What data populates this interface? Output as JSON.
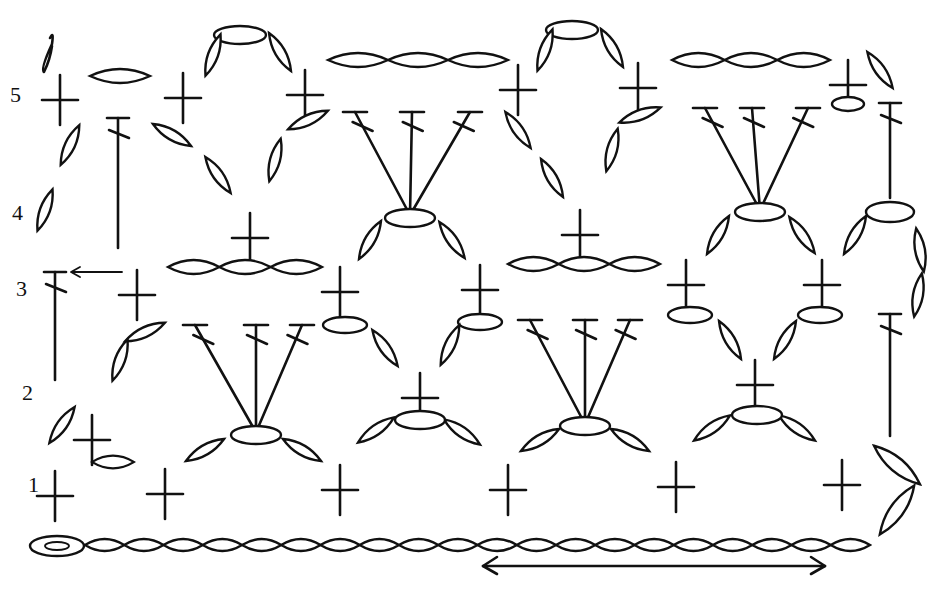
{
  "diagram": {
    "type": "crochet-stitch-chart",
    "ink_color": "#111111",
    "background_color": "#ffffff",
    "start_mark": "δ",
    "row_labels": [
      {
        "label": "1",
        "x": 28,
        "y": 492
      },
      {
        "label": "2",
        "x": 22,
        "y": 400
      },
      {
        "label": "3",
        "x": 16,
        "y": 296
      },
      {
        "label": "4",
        "x": 12,
        "y": 220
      },
      {
        "label": "5",
        "x": 10,
        "y": 102
      }
    ],
    "repeat_arrow": {
      "x1": 483,
      "x2": 825,
      "y": 566,
      "direction": "both"
    },
    "row3_turn_arrow": {
      "x1": 122,
      "x2": 70,
      "y": 272
    },
    "foundation_chain": {
      "start_x": 30,
      "end_x": 880,
      "y": 545,
      "count": 21,
      "first_is_slip_ring": true
    },
    "stitches": {
      "single_crochet": [
        [
          55,
          496
        ],
        [
          165,
          494
        ],
        [
          340,
          490
        ],
        [
          508,
          490
        ],
        [
          676,
          487
        ],
        [
          842,
          485
        ],
        [
          92,
          440
        ],
        [
          420,
          398
        ],
        [
          755,
          385
        ],
        [
          137,
          295
        ],
        [
          340,
          292
        ],
        [
          480,
          290
        ],
        [
          686,
          285
        ],
        [
          822,
          285
        ],
        [
          250,
          238
        ],
        [
          580,
          235
        ],
        [
          60,
          100
        ],
        [
          183,
          98
        ],
        [
          305,
          95
        ],
        [
          518,
          90
        ],
        [
          638,
          88
        ],
        [
          848,
          85
        ]
      ],
      "double_crochet_fans": [
        {
          "base": [
            256,
            432
          ],
          "tops": [
            [
              195,
              325
            ],
            [
              256,
              325
            ],
            [
              302,
              325
            ]
          ]
        },
        {
          "base": [
            585,
            424
          ],
          "tops": [
            [
              530,
              320
            ],
            [
              585,
              320
            ],
            [
              630,
              320
            ]
          ]
        },
        {
          "base": [
            410,
            215
          ],
          "tops": [
            [
              355,
              112
            ],
            [
              412,
              112
            ],
            [
              470,
              112
            ]
          ]
        },
        {
          "base": [
            760,
            210
          ],
          "tops": [
            [
              705,
              108
            ],
            [
              752,
              108
            ],
            [
              808,
              108
            ]
          ]
        }
      ],
      "single_double_crochet": [
        {
          "x": 55,
          "y_top": 272,
          "y_bottom": 380
        },
        {
          "x": 890,
          "y_top": 314,
          "y_bottom": 436
        },
        {
          "x": 890,
          "y_top": 103,
          "y_bottom": 198
        },
        {
          "x": 118,
          "y_top": 118,
          "y_bottom": 248
        }
      ],
      "chain_groups": [
        {
          "x1": 168,
          "x2": 322,
          "y": 267,
          "links": 3
        },
        {
          "x1": 508,
          "x2": 660,
          "y": 264,
          "links": 3
        },
        {
          "x1": 328,
          "x2": 508,
          "y": 60,
          "links": 3
        },
        {
          "x1": 672,
          "x2": 830,
          "y": 60,
          "links": 3
        }
      ],
      "arches": [
        {
          "cx": 240,
          "cy": 35
        },
        {
          "cx": 575,
          "cy": 30
        }
      ]
    }
  }
}
